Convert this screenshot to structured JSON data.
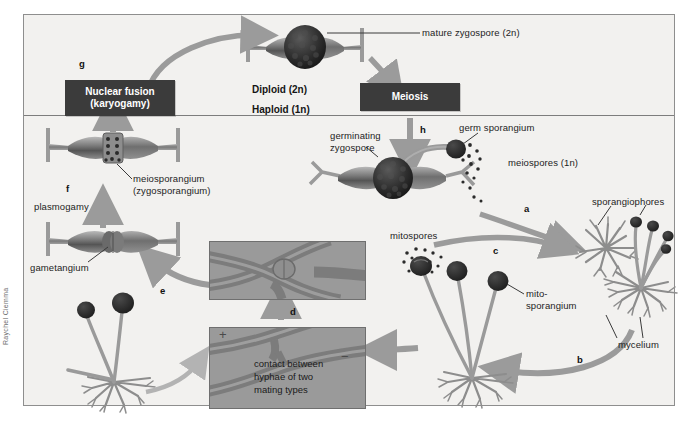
{
  "figure": {
    "credit": "Raychel Ciemma",
    "colors": {
      "background": "#f2f1ef",
      "frame_border": "#8e8e8e",
      "process_box": "#3b3b3b",
      "arrow": "#9b9b9b",
      "hypha": "#8d8d8d",
      "spore_dark": "#2b2b2b",
      "inset_panel": "#9a9a9a"
    }
  },
  "ploidy_labels": {
    "diploid": "Diploid (2n)",
    "haploid": "Haploid (1n)"
  },
  "process_boxes": [
    {
      "id": "karyogamy",
      "line1": "Nuclear fusion",
      "line2": "(karyogamy)"
    },
    {
      "id": "meiosis",
      "line1": "Meiosis",
      "line2": ""
    }
  ],
  "steps": [
    {
      "letter": "a"
    },
    {
      "letter": "b"
    },
    {
      "letter": "c"
    },
    {
      "letter": "d"
    },
    {
      "letter": "e"
    },
    {
      "letter": "f"
    },
    {
      "letter": "g"
    },
    {
      "letter": "h"
    }
  ],
  "labels": {
    "mature_zygospore": "mature zygospore (2n)",
    "germinating_zygospore_l1": "germinating",
    "germinating_zygospore_l2": "zygospore",
    "germ_sporangium": "germ sporangium",
    "meiospores": "meiospores (1n)",
    "sporangiophores": "sporangiophores",
    "mycelium": "mycelium",
    "mitospores": "mitospores",
    "mitosporangium_l1": "mito-",
    "mitosporangium_l2": "sporangium",
    "meiosporangium_l1": "meiosporangium",
    "meiosporangium_l2": "(zygosporangium)",
    "plasmogamy": "plasmogamy",
    "gametangium": "gametangium",
    "contact_l1": "contact between",
    "contact_l2": "hyphae of two",
    "contact_l3": "mating types",
    "mating_plus": "+",
    "mating_minus": "−"
  }
}
